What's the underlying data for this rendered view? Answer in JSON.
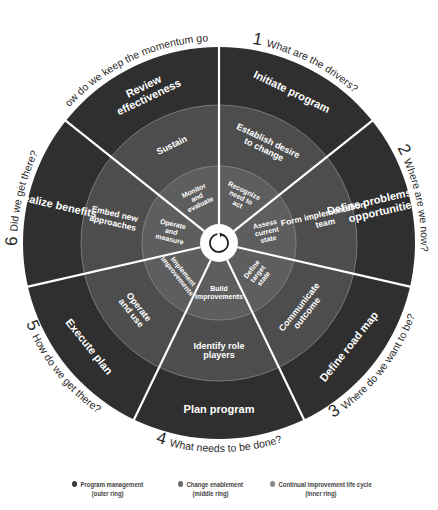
{
  "colors": {
    "outer": "#2f2f2f",
    "middle": "#4d4d4d",
    "inner": "#5e5e5e",
    "divider": "#ffffff",
    "ring_edge": "#8a8a8a",
    "hub": "#ffffff",
    "hub_ring": "#222222",
    "label": "#ffffff",
    "question": "#2a2a2a",
    "legend_outer": "#3a3a3a",
    "legend_middle": "#6a6a6a",
    "legend_inner": "#8a8a8a"
  },
  "wheel": {
    "center": [
      219,
      243
    ],
    "radii": {
      "hub": 19,
      "inner": 77,
      "middle": 138,
      "outer": 196
    },
    "sectors": [
      {
        "number": "1",
        "question": "What are the drivers?",
        "outer": [
          "Initiate program"
        ],
        "middle": [
          "Establish desire",
          "to change"
        ],
        "inner": [
          "Recognize",
          "need to",
          "act"
        ]
      },
      {
        "number": "2",
        "question": "Where are we now?",
        "outer": [
          "Define problems and",
          "opportunities"
        ],
        "middle": [
          "Form implementation",
          "team"
        ],
        "inner": [
          "Assess",
          "current",
          "state"
        ]
      },
      {
        "number": "3",
        "question": "Where do we want to be?",
        "outer": [
          "Define road map"
        ],
        "middle": [
          "Communicate",
          "outcome"
        ],
        "inner": [
          "Define",
          "target",
          "state"
        ]
      },
      {
        "number": "4",
        "question": "What needs to be done?",
        "outer": [
          "Plan program"
        ],
        "middle": [
          "Identify role",
          "players"
        ],
        "inner": [
          "Build",
          "improvements"
        ]
      },
      {
        "number": "5",
        "question": "How do we get there?",
        "outer": [
          "Execute plan"
        ],
        "middle": [
          "Operate",
          "and use"
        ],
        "inner": [
          "Implement",
          "improvements"
        ]
      },
      {
        "number": "6",
        "question": "Did we get there?",
        "outer": [
          "Realize benefits"
        ],
        "middle": [
          "Embed new",
          "approaches"
        ],
        "inner": [
          "Operate",
          "and",
          "measure"
        ]
      },
      {
        "number": "7",
        "question": "How do we keep the momentum going?",
        "outer": [
          "Review",
          "effectiveness"
        ],
        "middle": [
          "Sustain"
        ],
        "inner": [
          "Monitor",
          "and",
          "evaluate"
        ]
      }
    ]
  },
  "legend": [
    {
      "label": "Program management",
      "sub": "(outer ring)",
      "color_key": "legend_outer"
    },
    {
      "label": "Change enablement",
      "sub": "(middle ring)",
      "color_key": "legend_middle"
    },
    {
      "label": "Continual improvement life cycle",
      "sub": "(inner ring)",
      "color_key": "legend_inner"
    }
  ]
}
